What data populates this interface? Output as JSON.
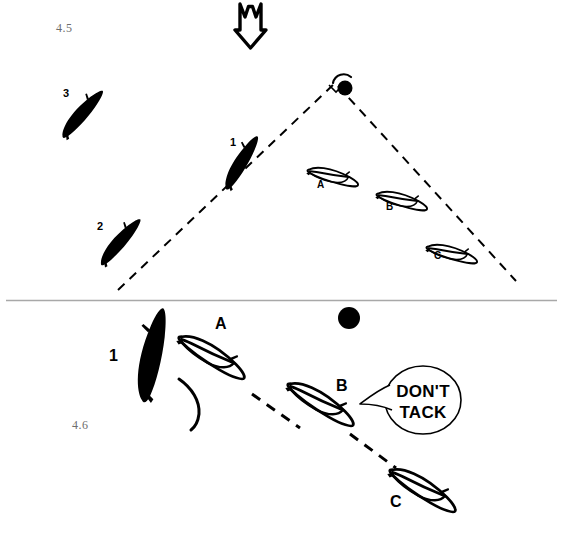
{
  "figures": [
    {
      "id": "fig-45",
      "number": "4.5"
    },
    {
      "id": "fig-46",
      "number": "4.6"
    }
  ],
  "colors": {
    "ink": "#000000",
    "paper": "#ffffff",
    "figure_number": "#6d6d6d",
    "divider": "#a8a8a8"
  },
  "wind_arrow": {
    "name": "wind-direction-arrow",
    "direction": "down",
    "style": "hollow-outlined-fletched-arrow"
  },
  "divider": {
    "name": "panel-divider-line",
    "y": 300
  },
  "upper_diagram": {
    "name": "diagram-4-5",
    "mark": {
      "label": "",
      "icon": "mark-buoy-dot"
    },
    "laylines": [
      {
        "name": "port-layline",
        "style": "dashed"
      },
      {
        "name": "starboard-layline",
        "style": "dashed"
      }
    ],
    "boats": [
      {
        "label": "3",
        "fill": "black",
        "x": 66,
        "y": 92
      },
      {
        "label": "2",
        "fill": "black",
        "x": 100,
        "y": 226
      },
      {
        "label": "1",
        "fill": "black",
        "x": 233,
        "y": 143
      },
      {
        "label": "A",
        "fill": "white",
        "x": 320,
        "y": 185
      },
      {
        "label": "B",
        "fill": "white",
        "x": 389,
        "y": 207
      },
      {
        "label": "C",
        "fill": "white",
        "x": 437,
        "y": 256
      }
    ]
  },
  "lower_diagram": {
    "name": "diagram-4-6",
    "mark": {
      "label": "",
      "icon": "mark-buoy-dot"
    },
    "dashed_path": {
      "name": "projected-course-line",
      "style": "dashed"
    },
    "wake": {
      "name": "boat-1-wake-trail"
    },
    "boats": [
      {
        "label": "1",
        "fill": "black",
        "x": 113,
        "y": 355
      },
      {
        "label": "A",
        "fill": "white",
        "x": 219,
        "y": 323
      },
      {
        "label": "B",
        "fill": "white",
        "x": 340,
        "y": 385
      },
      {
        "label": "C",
        "fill": "white",
        "x": 394,
        "y": 502
      }
    ],
    "speech_bubble": {
      "name": "dont-tack-speech-bubble",
      "line1": "DON'T",
      "line2": "TACK"
    }
  }
}
